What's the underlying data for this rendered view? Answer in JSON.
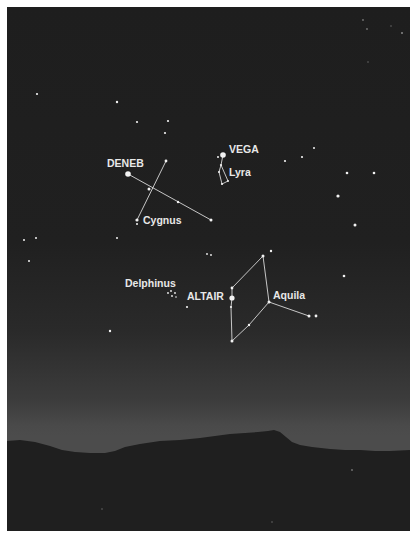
{
  "chart": {
    "colors": {
      "sky_top": "#1e1e1e",
      "sky_horizon": "#4c4c4c",
      "ground": "#1f1f1f",
      "star": "#f2f2f2",
      "line": "#d8d8d8",
      "label": "#e8e8e8"
    }
  },
  "labels": {
    "deneb": "DENEB",
    "vega": "VEGA",
    "lyra": "Lyra",
    "cygnus": "Cygnus",
    "delphinus": "Delphinus",
    "altair": "ALTAIR",
    "aquila": "Aquila"
  },
  "constellations": [
    {
      "name": "Cygnus",
      "bright_star": "DENEB"
    },
    {
      "name": "Lyra",
      "bright_star": "VEGA"
    },
    {
      "name": "Aquila",
      "bright_star": "ALTAIR"
    },
    {
      "name": "Delphinus",
      "bright_star": ""
    }
  ]
}
